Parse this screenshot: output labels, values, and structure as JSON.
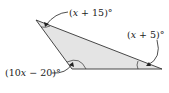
{
  "diagram": {
    "type": "triangle",
    "fill_color": "#e4e4e4",
    "stroke_color": "#333333",
    "angles": [
      {
        "vertex": "top",
        "label_pre": "(",
        "var": "x",
        "label_post": " + 15)°"
      },
      {
        "vertex": "right",
        "label_pre": "(",
        "var": "x",
        "label_post": " + 5)°"
      },
      {
        "vertex": "bottom-left",
        "label_pre": "(10",
        "var": "x",
        "label_post": " − 20)°"
      }
    ]
  }
}
